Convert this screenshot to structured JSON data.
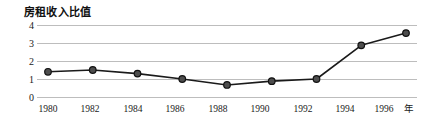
{
  "chart_data": {
    "type": "line",
    "title": "房租收入比值",
    "xlabel": "年",
    "ylabel": "",
    "categories": [
      "1980",
      "1982",
      "1984",
      "1986",
      "1988",
      "1990",
      "1992",
      "1994",
      "1996"
    ],
    "x": [
      1980,
      1982,
      1984,
      1986,
      1988,
      1990,
      1992,
      1994,
      1996
    ],
    "values": [
      1.4,
      1.5,
      1.3,
      1.0,
      0.67,
      0.88,
      1.0,
      2.87,
      3.55
    ],
    "series": [
      {
        "name": "房租收入比值",
        "values": [
          1.4,
          1.5,
          1.3,
          1.0,
          0.67,
          0.88,
          1.0,
          2.87,
          3.55
        ]
      }
    ],
    "ylim": [
      0,
      4
    ],
    "yticks": [
      0,
      1,
      2,
      3,
      4
    ],
    "ytick_labels": [
      "0",
      "1",
      "2",
      "3",
      "4"
    ],
    "xlim": [
      1980,
      1996
    ],
    "grid": true,
    "grid_color": "#bdbdbd",
    "legend": "none",
    "line_color": "#1a1a1a",
    "marker_fill": "#4d4d4d",
    "marker_edge": "#111111",
    "background": "#ffffff"
  },
  "axis": {
    "x_unit": "年"
  }
}
